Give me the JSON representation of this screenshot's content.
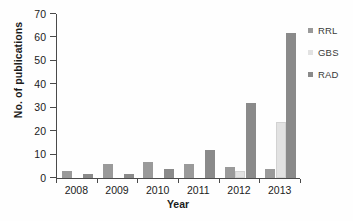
{
  "chart_data": {
    "type": "bar",
    "title": "",
    "xlabel": "Year",
    "ylabel": "No. of publications",
    "categories": [
      "2008",
      "2009",
      "2010",
      "2011",
      "2012",
      "2013"
    ],
    "series": [
      {
        "name": "RRL",
        "color": "#9a9a9a",
        "values": [
          2,
          5,
          6,
          5,
          4,
          3
        ]
      },
      {
        "name": "GBS",
        "color": "#e2e2e2",
        "values": [
          0,
          0,
          0,
          0,
          2,
          23
        ]
      },
      {
        "name": "RAD",
        "color": "#8a8a8a",
        "values": [
          1,
          1,
          3,
          11,
          31,
          61
        ]
      }
    ],
    "ylim": [
      0,
      70
    ],
    "yticks": [
      0,
      10,
      20,
      30,
      40,
      50,
      60,
      70
    ],
    "ytick_labels": [
      "0",
      "10",
      "20",
      "30",
      "40",
      "50",
      "60",
      "70"
    ],
    "grid": false,
    "legend_position": "right"
  },
  "legend": {
    "entries": [
      {
        "label": "RRL",
        "color": "#9a9a9a"
      },
      {
        "label": "GBS",
        "color": "#e2e2e2"
      },
      {
        "label": "RAD",
        "color": "#8a8a8a"
      }
    ]
  }
}
